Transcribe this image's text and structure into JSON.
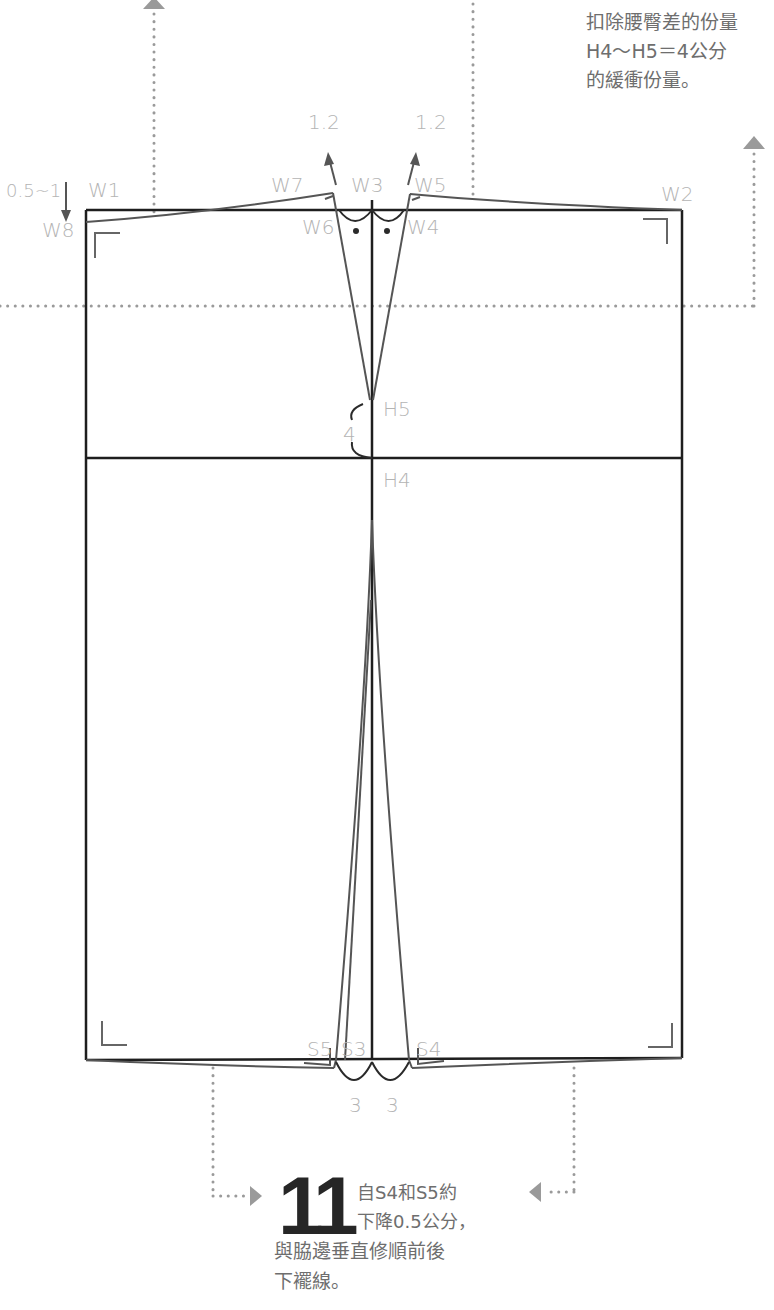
{
  "top_note": {
    "lines": [
      "扣除腰臀差的份量",
      "H4～H5＝4公分",
      "的緩衝份量。"
    ]
  },
  "labels": {
    "w1": "W1",
    "w2": "W2",
    "w3": "W3",
    "w4": "W4",
    "w5": "W5",
    "w6": "W6",
    "w7": "W7",
    "w8": "W8",
    "h4": "H4",
    "h5": "H5",
    "s3": "S3",
    "s4": "S4",
    "s5": "S5",
    "drop_left": "0.5~1",
    "dart_left": "1.2",
    "dart_right": "1.2",
    "hip_gap": "4",
    "hem_left": "3",
    "hem_right": "3"
  },
  "step": {
    "number": "11",
    "line1": "自S4和S5約",
    "line2": "下降0.5公分，",
    "line3": "與脇邊垂直修順前後",
    "line4": "下襬線。"
  },
  "colors": {
    "outline": "#1e1e1e",
    "pattern": "#555555",
    "label": "#b4b4b4",
    "dots": "#9a9a9a",
    "text": "#6e6e6e"
  }
}
